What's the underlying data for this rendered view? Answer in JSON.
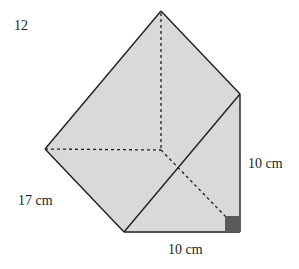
{
  "question_number": "12",
  "shape": "triangular prism",
  "labels": {
    "slant_length": "17 cm",
    "height": "10 cm",
    "base": "10 cm"
  },
  "colors": {
    "face_fill": "#d9d9d9",
    "edge": "#231f20",
    "right_angle_marker": "#5a5a5a"
  }
}
